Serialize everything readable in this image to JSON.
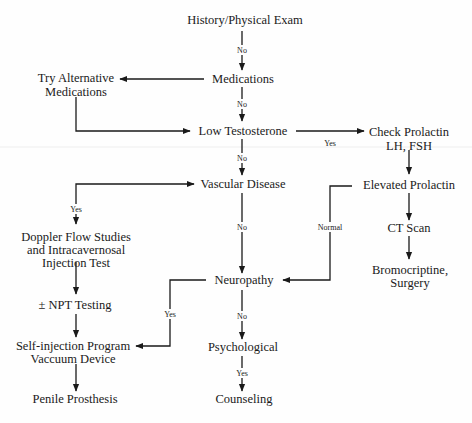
{
  "diagram": {
    "type": "flowchart",
    "colors": {
      "ink": "#1a1a1a",
      "background": "#fefefe"
    },
    "nodes": [
      {
        "id": "history",
        "lines": [
          "History/Physical Exam"
        ],
        "x": 250,
        "y": 22
      },
      {
        "id": "medications",
        "lines": [
          "Medications"
        ],
        "x": 250,
        "y": 80
      },
      {
        "id": "try_alt",
        "lines": [
          "Try Alternative",
          "Medications"
        ],
        "x": 75,
        "y": 77
      },
      {
        "id": "low_testosterone",
        "lines": [
          "Low Testosterone"
        ],
        "x": 250,
        "y": 132
      },
      {
        "id": "check_prolactin",
        "lines": [
          "Check Prolactin",
          "LH, FSH"
        ],
        "x": 408,
        "y": 132
      },
      {
        "id": "vascular",
        "lines": [
          "Vascular Disease"
        ],
        "x": 250,
        "y": 186
      },
      {
        "id": "elevated_prolactin",
        "lines": [
          "Elevated Prolactin"
        ],
        "x": 408,
        "y": 186
      },
      {
        "id": "doppler",
        "lines": [
          "Doppler Flow Studies",
          "and Intracavernosal",
          "Injection Test"
        ],
        "x": 75,
        "y": 238
      },
      {
        "id": "ct_scan",
        "lines": [
          "CT Scan"
        ],
        "x": 408,
        "y": 230
      },
      {
        "id": "bromocriptine",
        "lines": [
          "Bromocriptine,",
          "Surgery"
        ],
        "x": 410,
        "y": 273
      },
      {
        "id": "neuropathy",
        "lines": [
          "Neuropathy"
        ],
        "x": 250,
        "y": 284
      },
      {
        "id": "npt",
        "lines": [
          "± NPT Testing"
        ],
        "x": 75,
        "y": 306
      },
      {
        "id": "psychological",
        "lines": [
          "Psychological"
        ],
        "x": 250,
        "y": 350
      },
      {
        "id": "self_injection",
        "lines": [
          "Self-injection Program",
          "Vaccuum Device"
        ],
        "x": 75,
        "y": 350
      },
      {
        "id": "counseling",
        "lines": [
          "Counseling"
        ],
        "x": 250,
        "y": 402
      },
      {
        "id": "penile",
        "lines": [
          "Penile Prosthesis"
        ],
        "x": 75,
        "y": 402
      }
    ],
    "edges": [
      {
        "from": "history",
        "to": "medications",
        "label": "No"
      },
      {
        "from": "medications",
        "to": "try_alt",
        "label": ""
      },
      {
        "from": "medications",
        "to": "low_testosterone",
        "label": "No"
      },
      {
        "from": "try_alt",
        "to": "low_testosterone",
        "label": ""
      },
      {
        "from": "low_testosterone",
        "to": "check_prolactin",
        "label": "Yes"
      },
      {
        "from": "low_testosterone",
        "to": "vascular",
        "label": "No"
      },
      {
        "from": "check_prolactin",
        "to": "elevated_prolactin",
        "label": ""
      },
      {
        "from": "vascular",
        "to": "doppler",
        "label": "Yes"
      },
      {
        "from": "vascular",
        "to": "neuropathy",
        "label": "No"
      },
      {
        "from": "elevated_prolactin",
        "to": "ct_scan",
        "label": ""
      },
      {
        "from": "elevated_prolactin",
        "to": "neuropathy",
        "label": "Normal"
      },
      {
        "from": "ct_scan",
        "to": "bromocriptine",
        "label": ""
      },
      {
        "from": "doppler",
        "to": "npt",
        "label": ""
      },
      {
        "from": "npt",
        "to": "self_injection",
        "label": ""
      },
      {
        "from": "neuropathy",
        "to": "self_injection",
        "label": "Yes"
      },
      {
        "from": "neuropathy",
        "to": "psychological",
        "label": "No"
      },
      {
        "from": "psychological",
        "to": "counseling",
        "label": "Yes"
      },
      {
        "from": "self_injection",
        "to": "penile",
        "label": ""
      }
    ],
    "edge_labels": {
      "no": "No",
      "yes": "Yes",
      "normal": "Normal"
    }
  }
}
